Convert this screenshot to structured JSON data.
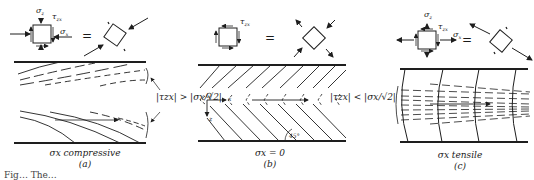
{
  "figure": {
    "panels": [
      {
        "id": "a",
        "condition_label": "σx compressive",
        "panel_letter": "(a)",
        "element_labels": {
          "sigma_z": "σz",
          "tau_zx": "τzx",
          "sigma_x": "σx"
        },
        "equals": "=",
        "inequality": "|τzx| > |σx/√2|",
        "line_style": "curved concave-down dashed/solid fan lines"
      },
      {
        "id": "b",
        "condition_label": "σx = 0",
        "panel_letter": "(b)",
        "element_labels": {
          "tau_zx": "τzx"
        },
        "equals": "=",
        "axis_labels": {
          "origin": "O",
          "x": "x",
          "z": "z"
        },
        "angle_label": "45°",
        "line_style": "straight parallel diagonals at 45°, chevron pattern"
      },
      {
        "id": "c",
        "condition_label": "σx tensile",
        "panel_letter": "(c)",
        "element_labels": {
          "sigma_z": "σz",
          "tau_zx": "τzx",
          "sigma_x": "σx"
        },
        "equals": "=",
        "inequality": "|τzx| < |σx/√2|",
        "line_style": "curved near-vertical solid lines with converging dashed lines"
      }
    ],
    "caption_visible": "Fig… The…"
  }
}
